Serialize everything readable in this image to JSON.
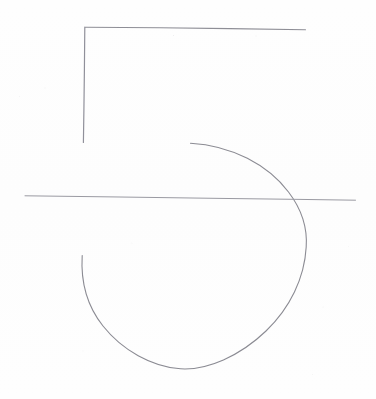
{
  "artwork": {
    "title": "Hand-drawn numeral five sketch",
    "subject": "5",
    "medium": "pen line drawing on paper",
    "canvas": {
      "width": 376,
      "height": 399
    },
    "background_color": "#fefefe",
    "stroke_color": "#8a8a92",
    "stroke_width": 1
  },
  "strokes": [
    {
      "name": "top-horizontal-stroke",
      "description": "upper horizontal bar of the five, sloping slightly downward to the right",
      "color": "#8e8e96",
      "width": 1.1,
      "path": "M 85.5 27.2 L 160 27.8 L 230 28.6 L 305.5 29.8"
    },
    {
      "name": "left-vertical-stroke",
      "description": "vertical descender on the left of the five",
      "color": "#90909a",
      "width": 1.2,
      "path": "M 84.8 27.0 L 84.4 70 L 83.9 110 L 83.4 142.5"
    },
    {
      "name": "bowl-arc-stroke",
      "description": "large open arc forming the bowl of the five, from upper middle sweeping right, down, around the bottom and back up to the left",
      "color": "#8b8b93",
      "width": 1.1,
      "path": "M 190.5 143.2 C 232 145.5, 268 165, 288.5 192 C 303 211, 307.5 228, 306.2 247 C 304.5 278, 290 308, 266 331 C 240 356, 207 370.5, 180.5 368.8 C 152 367, 122 350, 103 326 C 87 306, 80.5 284, 82.2 255.5"
    },
    {
      "name": "middle-horizontal-stroke",
      "description": "long horizontal rule crossing the whole drawing near the vertical middle",
      "color": "#9a9aa2",
      "width": 1.0,
      "path": "M 25.0 195.8 L 120 197.0 L 220 198.4 L 300 199.4 L 355.5 200.2"
    }
  ],
  "specks": [
    {
      "name": "paper-speck-top",
      "x": 173,
      "y": 35,
      "size": 1.4,
      "opacity": 0.42
    },
    {
      "name": "paper-speck-left",
      "x": 19,
      "y": 96,
      "size": 1.1,
      "opacity": 0.22
    },
    {
      "name": "paper-speck-lower-right",
      "x": 312,
      "y": 374,
      "size": 1.2,
      "opacity": 0.26
    },
    {
      "name": "paper-speck-mid-right",
      "x": 348,
      "y": 246,
      "size": 1.0,
      "opacity": 0.18
    }
  ]
}
